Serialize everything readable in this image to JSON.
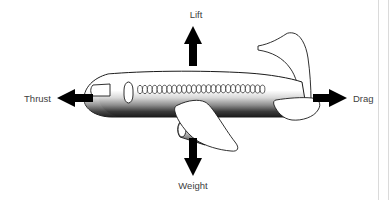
{
  "diagram": {
    "background_color": "#ffffff",
    "label_color": "#404040",
    "arrow_color": "#000000",
    "outline_color": "#1a1a1a",
    "fuselage_top_color": "#ffffff",
    "fuselage_bottom_color": "#1f1f1f",
    "frame_color": "#dadada",
    "forces": [
      {
        "id": "lift",
        "label": "Lift",
        "direction": "up",
        "label_x": 196,
        "label_y": 18,
        "arrow_x": 193,
        "arrow_tip_y": 26,
        "arrow_tail_y": 66
      },
      {
        "id": "thrust",
        "label": "Thrust",
        "direction": "left",
        "label_x": 41,
        "label_y": 102,
        "arrow_y": 98,
        "arrow_tip_x": 57,
        "arrow_tail_x": 93
      },
      {
        "id": "drag",
        "label": "Drag",
        "direction": "right",
        "label_x": 350,
        "label_y": 102,
        "arrow_y": 98,
        "arrow_tail_x": 313,
        "arrow_tip_x": 347
      },
      {
        "id": "weight",
        "label": "Weight",
        "direction": "down",
        "label_x": 193,
        "label_y": 189,
        "arrow_x": 193,
        "arrow_tail_y": 138,
        "arrow_tip_y": 176
      }
    ],
    "aircraft": {
      "name": "jet-airliner",
      "window_count": 26,
      "parts": [
        "fuselage",
        "cockpit-window",
        "cabin-door",
        "passenger-windows",
        "vertical-stabilizer",
        "horizontal-stabilizer",
        "main-wing",
        "engine-nacelle"
      ]
    }
  }
}
